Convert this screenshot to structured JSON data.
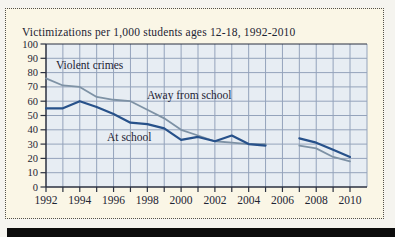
{
  "figure": {
    "title": "Victimizations per 1,000 students ages 12-18, 1992-2010"
  },
  "colors": {
    "page_bg": "#f5f4ef",
    "panel_bg": "#faf6e6",
    "panel_border": "#52504a",
    "plot_bg": "#e7edf3",
    "grid": "#94a3bb",
    "axis": "#2b3140",
    "text": "#1d2433",
    "series_away": "#7e92a5",
    "series_at_school": "#27518a",
    "black_bar": "#0c0c0c"
  },
  "chart_data": {
    "type": "line",
    "title": "Victimizations per 1,000 students ages 12-18, 1992-2010",
    "annotation": "Violent crimes",
    "xlabel": "",
    "ylabel": "",
    "ylim": [
      0,
      100
    ],
    "ytick_interval": 10,
    "grid": true,
    "legend_position": "inline-labels",
    "x": [
      1992,
      1993,
      1994,
      1995,
      1996,
      1997,
      1998,
      1999,
      2000,
      2001,
      2002,
      2003,
      2004,
      2005,
      2006,
      2007,
      2008,
      2009,
      2010
    ],
    "xtick_label_years": [
      1992,
      1994,
      1996,
      1998,
      2000,
      2002,
      2004,
      2006,
      2008,
      2010
    ],
    "note": "no data plotted for 2006 (gap in both lines)",
    "series": [
      {
        "name": "Away from school",
        "values": [
          76,
          71,
          70,
          63,
          61,
          60,
          54,
          48,
          40,
          36,
          32,
          31,
          30,
          30,
          null,
          29,
          27,
          21,
          18
        ]
      },
      {
        "name": "At school",
        "values": [
          55,
          55,
          60,
          56,
          51,
          45,
          44,
          41,
          33,
          35,
          32,
          36,
          30,
          29,
          null,
          34,
          31,
          26,
          21
        ]
      }
    ]
  }
}
